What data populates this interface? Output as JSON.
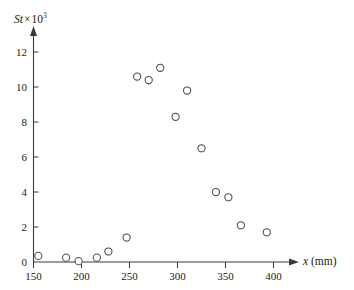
{
  "chart_data": {
    "type": "scatter",
    "title": "",
    "ylabel_symbol": "St",
    "ylabel_times": "×",
    "ylabel_base": "10",
    "ylabel_exponent": "3",
    "ylabel_full": "St × 10³",
    "xlabel_symbol": "x",
    "xlabel_unit": "(mm)",
    "xlabel_full": "x (mm)",
    "xticks": [
      "150",
      "200",
      "250",
      "300",
      "350",
      "400"
    ],
    "xtick_values": [
      150,
      200,
      250,
      300,
      350,
      400
    ],
    "yticks": [
      "0",
      "2",
      "4",
      "6",
      "8",
      "10",
      "12"
    ],
    "ytick_values": [
      0,
      2,
      4,
      6,
      8,
      10,
      12
    ],
    "xlim": [
      150,
      408
    ],
    "ylim": [
      0,
      12.9
    ],
    "grid": false,
    "legend": false,
    "marker_style": "open-circle",
    "marker_color": "#4a4a52",
    "marker_fill": "#ffffff",
    "axis_color": "#3a3a3a",
    "background_color": "#ffffff",
    "points": [
      {
        "x": 155,
        "y": 0.35
      },
      {
        "x": 184,
        "y": 0.25
      },
      {
        "x": 197,
        "y": 0.05
      },
      {
        "x": 216,
        "y": 0.25
      },
      {
        "x": 228,
        "y": 0.6
      },
      {
        "x": 247,
        "y": 1.4
      },
      {
        "x": 258,
        "y": 10.6
      },
      {
        "x": 270,
        "y": 10.4
      },
      {
        "x": 282,
        "y": 11.1
      },
      {
        "x": 298,
        "y": 8.3
      },
      {
        "x": 310,
        "y": 9.8
      },
      {
        "x": 325,
        "y": 6.5
      },
      {
        "x": 340,
        "y": 4.0
      },
      {
        "x": 353,
        "y": 3.7
      },
      {
        "x": 366,
        "y": 2.1
      },
      {
        "x": 393,
        "y": 1.7
      }
    ]
  }
}
